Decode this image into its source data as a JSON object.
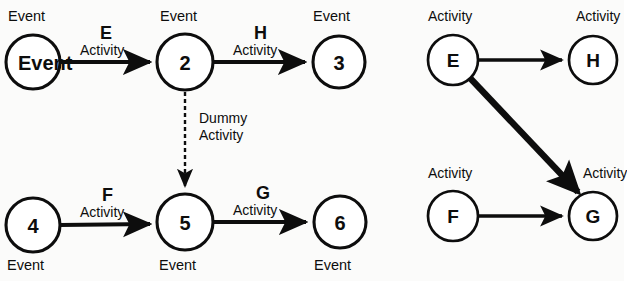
{
  "figure": {
    "background_color": "#fbfbfa",
    "ink_color": "#0d0d0d"
  },
  "left_diagram": {
    "name": "activity-on-arrow-network",
    "nodes": [
      {
        "id": "n1",
        "label": "1",
        "caption": "Event",
        "cx": 33,
        "cy": 62,
        "r": 27
      },
      {
        "id": "n2",
        "label": "2",
        "caption": "Event",
        "cx": 185,
        "cy": 62,
        "r": 28
      },
      {
        "id": "n3",
        "label": "3",
        "caption": "Event",
        "cx": 339,
        "cy": 62,
        "r": 26
      },
      {
        "id": "n4",
        "label": "4",
        "caption": "Event",
        "cx": 33,
        "cy": 225,
        "r": 27
      },
      {
        "id": "n5",
        "label": "5",
        "caption": "Event",
        "cx": 185,
        "cy": 222,
        "r": 28
      },
      {
        "id": "n6",
        "label": "6",
        "caption": "Event",
        "cx": 340,
        "cy": 222,
        "r": 26
      }
    ],
    "edges": [
      {
        "id": "e-E",
        "from": "1",
        "to": "2",
        "code": "E",
        "caption": "Activity",
        "style": "solid"
      },
      {
        "id": "e-H",
        "from": "2",
        "to": "3",
        "code": "H",
        "caption": "Activity",
        "style": "solid"
      },
      {
        "id": "e-F",
        "from": "4",
        "to": "5",
        "code": "F",
        "caption": "Activity",
        "style": "solid"
      },
      {
        "id": "e-G",
        "from": "5",
        "to": "6",
        "code": "G",
        "caption": "Activity",
        "style": "solid"
      },
      {
        "id": "e-dummy",
        "from": "2",
        "to": "5",
        "code": "Dummy",
        "caption": "Activity",
        "style": "dashed"
      }
    ],
    "labels": {
      "event_1": "Event",
      "event_2": "Event",
      "event_3": "Event",
      "event_4": "Event",
      "event_5": "Event",
      "event_6": "Event",
      "code_E": "E",
      "code_H": "H",
      "code_F": "F",
      "code_G": "G",
      "activity_E": "Activity",
      "activity_H": "Activity",
      "activity_F": "Activity",
      "activity_G": "Activity",
      "dummy_line1": "Dummy",
      "dummy_line2": "Activity"
    }
  },
  "right_diagram": {
    "name": "activity-on-node-network",
    "nodes": [
      {
        "id": "aE",
        "label": "E",
        "caption": "Activity",
        "cx": 453,
        "cy": 60,
        "r": 25
      },
      {
        "id": "aH",
        "label": "H",
        "caption": "Activity",
        "cx": 593,
        "cy": 60,
        "r": 24
      },
      {
        "id": "aF",
        "label": "F",
        "caption": "Activity",
        "cx": 453,
        "cy": 216,
        "r": 25
      },
      {
        "id": "aG",
        "label": "G",
        "caption": "Activity",
        "cx": 593,
        "cy": 216,
        "r": 24
      }
    ],
    "edges": [
      {
        "id": "r-EH",
        "from": "E",
        "to": "H",
        "style": "solid",
        "weight": "thin"
      },
      {
        "id": "r-FG",
        "from": "F",
        "to": "G",
        "style": "solid",
        "weight": "thin"
      },
      {
        "id": "r-EG",
        "from": "E",
        "to": "G",
        "style": "solid",
        "weight": "thick"
      }
    ],
    "labels": {
      "activity_E": "Activity",
      "activity_H": "Activity",
      "activity_F": "Activity",
      "activity_G": "Activity"
    }
  }
}
